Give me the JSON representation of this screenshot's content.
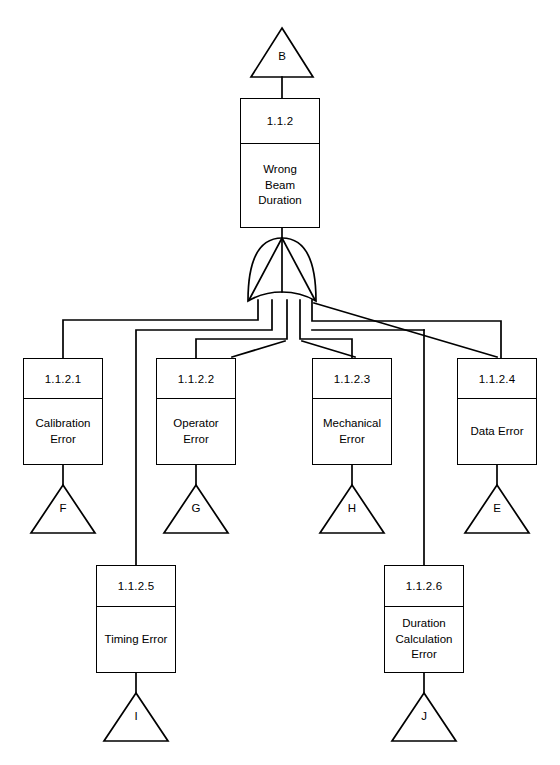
{
  "diagram": {
    "type": "fault-tree",
    "gate": {
      "type": "OR",
      "name": "or-gate"
    }
  },
  "top_transfer": {
    "label": "B"
  },
  "top_event": {
    "id": "1.1.2",
    "description": "Wrong\nBeam\nDuration"
  },
  "intermediate_events": [
    {
      "id": "1.1.2.1",
      "description": "Calibration\nError",
      "transfer": "F"
    },
    {
      "id": "1.1.2.2",
      "description": "Operator\nError",
      "transfer": "G"
    },
    {
      "id": "1.1.2.3",
      "description": "Mechanical\nError",
      "transfer": "H"
    },
    {
      "id": "1.1.2.4",
      "description": "Data Error",
      "transfer": "E"
    }
  ],
  "lower_events": [
    {
      "id": "1.1.2.5",
      "description": "Timing Error",
      "transfer": "I"
    },
    {
      "id": "1.1.2.6",
      "description": "Duration\nCalculation\nError",
      "transfer": "J"
    }
  ],
  "style": {
    "line_color": "#000000",
    "background": "#ffffff",
    "fill": "#ffffff"
  }
}
